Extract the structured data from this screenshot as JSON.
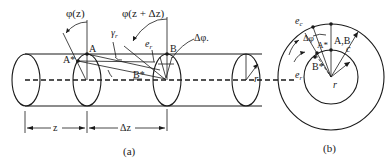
{
  "figure_a": {
    "caption": "(a)",
    "labels": {
      "phi_z": "φ(z)",
      "phi_z_dz": "φ(z + Δz)",
      "gamma": "γ",
      "gamma_sub": "r",
      "e_r": "e",
      "e_r_sub": "r",
      "A": "A",
      "B": "B",
      "A_star": "A*",
      "B_star": "B*",
      "delta_phi": "Δφ.",
      "r": "r",
      "z": "z",
      "dz": "Δz"
    }
  },
  "figure_b": {
    "caption": "(b)",
    "labels": {
      "e_c": "e",
      "e_c_sub": "c",
      "delta_phi": "Δφ",
      "A_star": "A*",
      "AB": "A,B",
      "c": "c",
      "e_r": "e",
      "e_r_sub": "r",
      "B_star": "B*",
      "r": "r"
    }
  },
  "colors": {
    "ink": "#1a1a1a",
    "background": "#ffffff"
  }
}
